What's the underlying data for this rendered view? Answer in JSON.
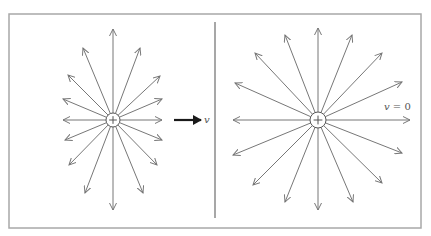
{
  "figure": {
    "width": 431,
    "height": 236,
    "colors": {
      "background": "#ffffff",
      "frame": "#a8a8a8",
      "divider": "#8a8a8a",
      "field_line": "#777777",
      "charge_outline": "#555555",
      "velocity_arrow": "#1a1a1a",
      "label": "#555555"
    },
    "frame": {
      "x": 9,
      "y": 14,
      "width": 412,
      "height": 214
    },
    "divider": {
      "x": 215,
      "y1": 22,
      "y2": 218
    }
  },
  "left_panel": {
    "description": "Field of a moving positive charge (field lines compressed toward the perpendicular direction)",
    "charge": {
      "cx": 113,
      "cy": 120,
      "r": 7,
      "sign": "+"
    },
    "field_line_endpoints": [
      [
        113,
        29
      ],
      [
        140,
        48
      ],
      [
        160,
        76
      ],
      [
        162,
        99
      ],
      [
        162,
        120
      ],
      [
        162,
        140
      ],
      [
        157,
        165
      ],
      [
        143,
        193
      ],
      [
        113,
        210
      ],
      [
        85,
        193
      ],
      [
        69,
        165
      ],
      [
        65,
        140
      ],
      [
        63,
        120
      ],
      [
        63,
        99
      ],
      [
        68,
        75
      ],
      [
        83,
        48
      ]
    ],
    "velocity": {
      "x1": 174,
      "y1": 120,
      "x2": 201,
      "y2": 120,
      "label": "v",
      "label_x": 204,
      "label_y": 123
    }
  },
  "right_panel": {
    "description": "Field of a stationary positive charge (radially symmetric field lines)",
    "charge": {
      "cx": 318,
      "cy": 120,
      "r": 8,
      "sign": "+"
    },
    "field_line_endpoints": [
      [
        318,
        28
      ],
      [
        352,
        35
      ],
      [
        382,
        53
      ],
      [
        402,
        82
      ],
      [
        410,
        120
      ],
      [
        402,
        153
      ],
      [
        382,
        183
      ],
      [
        353,
        202
      ],
      [
        318,
        210
      ],
      [
        285,
        202
      ],
      [
        253,
        185
      ],
      [
        233,
        155
      ],
      [
        233,
        120
      ],
      [
        235,
        83
      ],
      [
        255,
        53
      ],
      [
        285,
        35
      ]
    ],
    "velocity_label": {
      "text_v": "v",
      "text_rest": " = 0",
      "x": 384,
      "y": 110
    }
  }
}
